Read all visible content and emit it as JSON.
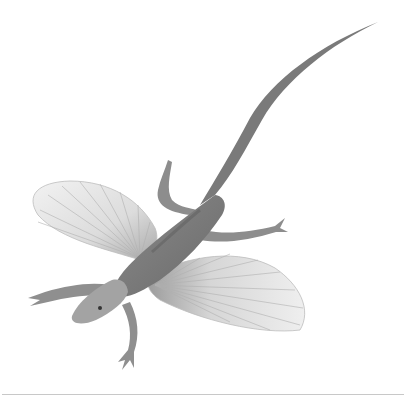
{
  "image": {
    "subject": "gliding lizard illustration",
    "palette": {
      "background": "#ffffff",
      "body_dark": "#6e6e6e",
      "body_mid": "#9a9a9a",
      "wing_fill": "#e4e4e4",
      "wing_ribs": "#a8a8a8",
      "rule": "#c8c8c8"
    }
  }
}
